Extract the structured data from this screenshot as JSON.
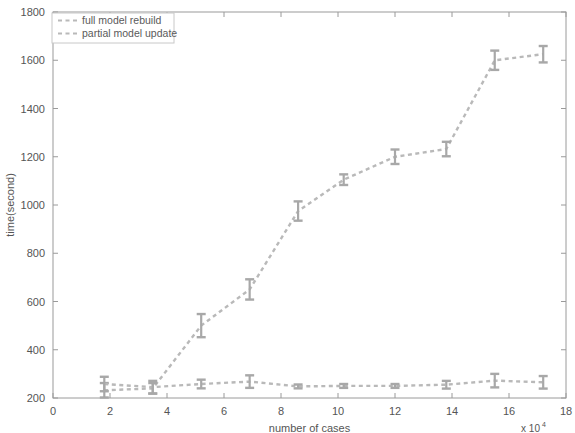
{
  "chart_data": {
    "type": "line",
    "title": "",
    "subtitle": "",
    "xlabel": "number of cases",
    "ylabel": "time(second)",
    "x_multiplier": "x 10",
    "x_multiplier_exponent": "4",
    "xlim": [
      0,
      18
    ],
    "ylim": [
      200,
      1800
    ],
    "xticks": [
      0,
      2,
      4,
      6,
      8,
      10,
      12,
      14,
      16,
      18
    ],
    "xtick_labels": [
      "0",
      "2",
      "4",
      "6",
      "8",
      "10",
      "12",
      "14",
      "16",
      "18"
    ],
    "yticks": [
      200,
      400,
      600,
      800,
      1000,
      1200,
      1400,
      1600,
      1800
    ],
    "ytick_labels": [
      "200",
      "400",
      "600",
      "800",
      "1000",
      "1200",
      "1400",
      "1600",
      "1800"
    ],
    "grid": false,
    "legend_position": "top-left",
    "line_color": "#b9b9b9",
    "marker_color": "#a8a8a8",
    "axis_color": "#9a9a9a",
    "text_color": "#555555",
    "background": "#ffffff",
    "series": [
      {
        "name": "full model rebuild",
        "style": "dashed",
        "x": [
          1.8,
          3.5,
          5.2,
          6.9,
          8.6,
          10.2,
          12.0,
          13.8,
          15.5,
          17.2
        ],
        "values": [
          232,
          240,
          500,
          650,
          975,
          1105,
          1200,
          1232,
          1600,
          1625
        ],
        "errors": [
          30,
          22,
          48,
          42,
          40,
          22,
          30,
          30,
          40,
          34
        ]
      },
      {
        "name": "partial model update",
        "style": "dashed",
        "x": [
          1.8,
          3.5,
          5.2,
          6.9,
          8.6,
          10.2,
          12.0,
          13.8,
          15.5,
          17.2
        ],
        "values": [
          258,
          245,
          258,
          268,
          248,
          250,
          250,
          255,
          272,
          265
        ],
        "errors": [
          30,
          26,
          18,
          26,
          8,
          8,
          8,
          16,
          28,
          26
        ]
      }
    ]
  },
  "legend": {
    "entries": [
      {
        "label": "full model rebuild"
      },
      {
        "label": "partial model update"
      }
    ]
  }
}
